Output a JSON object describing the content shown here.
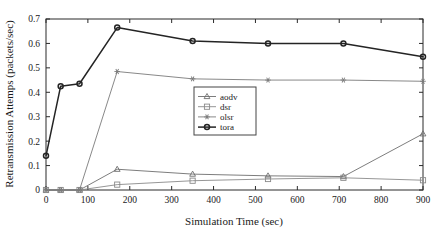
{
  "chart_data": {
    "type": "line",
    "title": "",
    "xlabel": "Simulation Time (sec)",
    "ylabel": "Retransmission Attemps (packets/sec)",
    "xlim": [
      0,
      900
    ],
    "ylim": [
      0,
      0.7
    ],
    "xticks": [
      0,
      100,
      200,
      300,
      400,
      500,
      600,
      700,
      800,
      900
    ],
    "xtick_labels": [
      "0",
      "100",
      "200",
      "300",
      "400",
      "500",
      "600",
      "700",
      "800",
      "900"
    ],
    "yticks": [
      0,
      0.1,
      0.2,
      0.3,
      0.4,
      0.5,
      0.6,
      0.7
    ],
    "ytick_labels": [
      "0",
      "0.1",
      "0.2",
      "0.3",
      "0.4",
      "0.5",
      "0.6",
      "0.7"
    ],
    "grid": false,
    "legend_position": "center-left-inside",
    "series": [
      {
        "name": "aodv",
        "marker": "triangle",
        "color": "#6e6e6e",
        "x": [
          0,
          35,
          80,
          170,
          350,
          530,
          710,
          900
        ],
        "values": [
          0,
          0,
          0,
          0.085,
          0.065,
          0.058,
          0.055,
          0.23
        ]
      },
      {
        "name": "dsr",
        "marker": "square",
        "color": "#8a8a8a",
        "x": [
          0,
          35,
          80,
          170,
          350,
          530,
          710,
          900
        ],
        "values": [
          0,
          0,
          0,
          0.022,
          0.038,
          0.045,
          0.05,
          0.04
        ]
      },
      {
        "name": "olsr",
        "marker": "asterisk",
        "color": "#7a7a7a",
        "x": [
          0,
          35,
          80,
          170,
          350,
          530,
          710,
          900
        ],
        "values": [
          0,
          0,
          0,
          0.485,
          0.455,
          0.45,
          0.45,
          0.445
        ]
      },
      {
        "name": "tora",
        "marker": "circle",
        "color": "#242424",
        "x": [
          0,
          35,
          80,
          170,
          350,
          530,
          710,
          900
        ],
        "values": [
          0.14,
          0.425,
          0.435,
          0.665,
          0.61,
          0.6,
          0.6,
          0.545
        ]
      }
    ]
  },
  "legend": {
    "entries": [
      "aodv",
      "dsr",
      "olsr",
      "tora"
    ]
  },
  "axes": {
    "x_title": "Simulation Time (sec)",
    "y_title": "Retransmission Attemps (packets/sec)"
  }
}
